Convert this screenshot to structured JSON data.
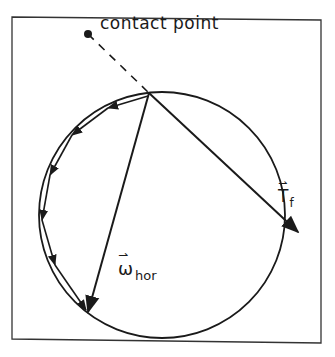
{
  "diagram": {
    "labels": {
      "contact_point": "contact point",
      "torque_symbol": "T",
      "torque_subscript": "f",
      "omega_symbol": "ω",
      "omega_subscript": "hor",
      "vector_arrow": "⇀"
    },
    "colors": {
      "background": "#ffffff",
      "stroke": "#1a1a1a"
    },
    "geometry": {
      "frame": {
        "x1": 12,
        "y1": 17,
        "x2": 321,
        "y2": 343
      },
      "circle": {
        "cx": 162,
        "cy": 215,
        "r": 123
      },
      "contact_point": {
        "x": 88,
        "y": 34
      },
      "pivot_point": {
        "x": 149,
        "y": 93
      },
      "torque_arrow_tip": {
        "x": 298,
        "y": 232
      },
      "omega_arrow_tip": {
        "x": 88,
        "y": 312
      },
      "path_arrows_count": 7
    }
  }
}
